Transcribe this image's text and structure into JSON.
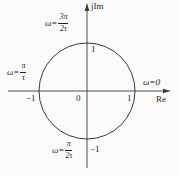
{
  "diagram": {
    "axes": {
      "imaginary_label": "jIm",
      "real_label": "Re"
    },
    "ticks": {
      "origin": "0",
      "real_positive": "1",
      "real_negative": "−1",
      "imag_positive": "1",
      "imag_negative": "−1"
    },
    "annotations": {
      "right": {
        "text": "ω=0"
      },
      "top": {
        "prefix": "ω=",
        "num": "3π",
        "den": "2τ"
      },
      "left": {
        "prefix": "ω=",
        "num": "π",
        "den": "τ"
      },
      "bottom": {
        "prefix": "ω=",
        "num": "π",
        "den": "2τ"
      }
    },
    "colors": {
      "stroke": "#3a3a3a",
      "text": "#1f1f1f",
      "background": "#fbfbfb"
    }
  }
}
